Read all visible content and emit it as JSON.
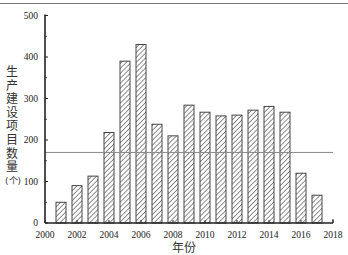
{
  "chart_data": {
    "type": "bar",
    "title": "",
    "xlabel": "年份",
    "ylabel": "生产建设项目数量(个)",
    "categories": [
      "2001",
      "2002",
      "2003",
      "2004",
      "2005",
      "2006",
      "2007",
      "2008",
      "2009",
      "2010",
      "2011",
      "2012",
      "2013",
      "2014",
      "2015",
      "2016",
      "2017"
    ],
    "values": [
      50,
      90,
      113,
      218,
      390,
      430,
      238,
      210,
      284,
      267,
      258,
      260,
      272,
      281,
      267,
      120,
      67
    ],
    "ylim": [
      0,
      500
    ],
    "xlim": [
      2000,
      2018
    ],
    "yticks": [
      0,
      100,
      200,
      300,
      400,
      500
    ],
    "xticks": [
      2000,
      2002,
      2004,
      2006,
      2008,
      2010,
      2012,
      2014,
      2016,
      2018
    ],
    "reference_line": {
      "value": 170,
      "orientation": "horizontal"
    },
    "bar_style": "diagonal-hatch",
    "grid": false,
    "legend": null
  },
  "axis": {
    "xlabel": "年份",
    "ylabel_chars": [
      "生",
      "产",
      "建",
      "设",
      "项",
      "目",
      "数",
      "量",
      "(个)"
    ]
  }
}
